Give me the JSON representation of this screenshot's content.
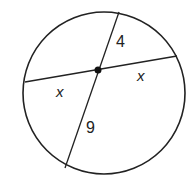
{
  "diagram": {
    "type": "intersecting-chords",
    "labels": {
      "top_segment": "4",
      "bottom_segment": "9",
      "left_segment": "x",
      "right_segment": "x"
    },
    "colors": {
      "stroke": "#222222",
      "background": "#ffffff"
    }
  }
}
